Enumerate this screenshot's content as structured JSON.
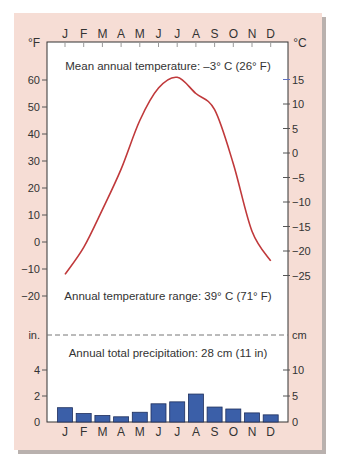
{
  "chart_data": {
    "type": "climograph",
    "months": [
      "J",
      "F",
      "M",
      "A",
      "M",
      "J",
      "J",
      "A",
      "S",
      "O",
      "N",
      "D"
    ],
    "temperature": {
      "type": "line",
      "unit_left": "°F",
      "unit_right": "°C",
      "values_f": [
        -12,
        -2,
        12,
        27,
        45,
        57,
        61,
        55,
        49,
        29,
        4,
        -7
      ],
      "left_ticks": [
        "60",
        "50",
        "40",
        "30",
        "20",
        "10",
        "0",
        "−10",
        "−20"
      ],
      "left_tick_values": [
        60,
        50,
        40,
        30,
        20,
        10,
        0,
        -10,
        -20
      ],
      "right_ticks": [
        "15",
        "10",
        "5",
        "0",
        "−5",
        "−10",
        "−15",
        "−20",
        "−25"
      ],
      "right_tick_values": [
        15,
        10,
        5,
        0,
        -5,
        -10,
        -15,
        -20,
        -25
      ],
      "color": "#c0393b"
    },
    "precipitation": {
      "type": "bar",
      "unit_left": "in.",
      "unit_right": "cm",
      "values_in": [
        1.1,
        0.65,
        0.5,
        0.4,
        0.75,
        1.4,
        1.55,
        2.15,
        1.15,
        1.0,
        0.7,
        0.55
      ],
      "left_ticks": [
        "4",
        "2",
        "0"
      ],
      "left_tick_values": [
        4,
        2,
        0
      ],
      "right_ticks": [
        "10",
        "5",
        "0"
      ],
      "right_tick_values_cm": [
        10,
        5,
        0
      ],
      "color": "#3b5fa8"
    },
    "annotations": {
      "mean_temp": "Mean annual temperature: –3° C (26° F)",
      "temp_range": "Annual temperature range: 39° C (71° F)",
      "precip_total": "Annual total precipitation: 28 cm (11 in)"
    }
  }
}
